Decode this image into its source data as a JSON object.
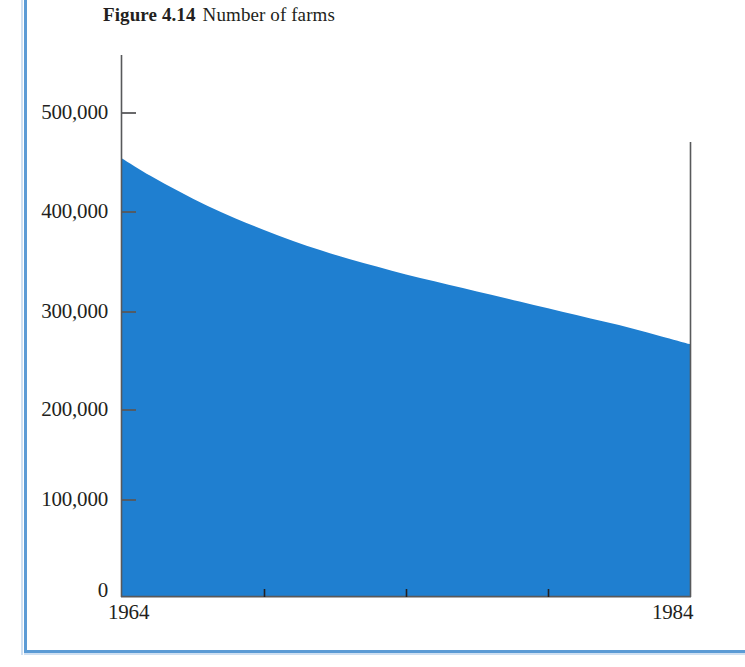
{
  "caption": {
    "figure_number": "Figure 4.14",
    "figure_title": "Number of farms"
  },
  "colors": {
    "area_fill": "#1f7fd0",
    "axis": "#58595b",
    "text": "#231f20",
    "frame_rule": "#5b9bd5"
  },
  "axes": {
    "y_tick_labels": [
      "500,000",
      "400,000",
      "300,000",
      "200,000",
      "100,000",
      "0"
    ],
    "x_tick_labels": [
      "1964",
      "1984"
    ]
  },
  "chart_data": {
    "type": "area",
    "title": "Number of farms",
    "xlabel": "",
    "ylabel": "",
    "xlim": [
      1964,
      1984
    ],
    "ylim": [
      0,
      500000
    ],
    "grid": false,
    "legend": "none",
    "yticks": [
      0,
      100000,
      200000,
      300000,
      400000,
      500000
    ],
    "ytick_labels": [
      "0",
      "100,000",
      "200,000",
      "300,000",
      "400,000",
      "500,000"
    ],
    "xticks": [
      1964,
      1969,
      1974,
      1979,
      1984
    ],
    "xtick_labels": [
      "1964",
      "",
      "",
      "",
      "1984"
    ],
    "x": [
      1964,
      1965,
      1966,
      1967,
      1968,
      1969,
      1970,
      1971,
      1972,
      1973,
      1974,
      1975,
      1976,
      1977,
      1978,
      1979,
      1980,
      1981,
      1982,
      1983,
      1984
    ],
    "values": [
      453000,
      435000,
      419000,
      404000,
      391000,
      379000,
      368000,
      358000,
      349000,
      341000,
      333000,
      326000,
      319000,
      312000,
      305000,
      298000,
      291000,
      284000,
      277000,
      269000,
      261000
    ],
    "series": [
      {
        "name": "Number of farms",
        "values": [
          453000,
          435000,
          419000,
          404000,
          391000,
          379000,
          368000,
          358000,
          349000,
          341000,
          333000,
          326000,
          319000,
          312000,
          305000,
          298000,
          291000,
          284000,
          277000,
          269000,
          261000
        ]
      }
    ]
  }
}
